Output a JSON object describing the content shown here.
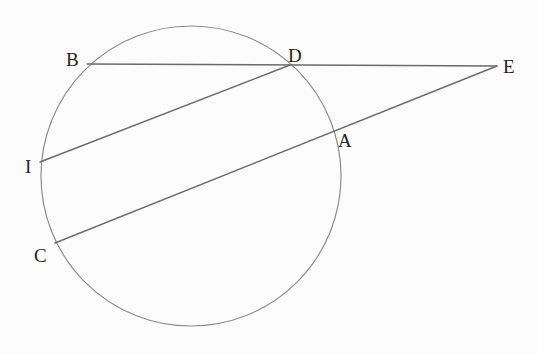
{
  "figure": {
    "type": "geometry-diagram",
    "labels": {
      "B": "B",
      "D": "D",
      "E": "E",
      "A": "A",
      "I": "I",
      "C": "C"
    },
    "elements": {
      "circle_points": [
        "B",
        "D",
        "A",
        "C",
        "I"
      ],
      "external_point": "E",
      "segments": [
        "B-D-E",
        "C-A-E",
        "I-D"
      ]
    }
  },
  "colors": {
    "background": "#fcfcfc",
    "line": "#6b6b6b",
    "circle_stroke": "#8c8c8c",
    "label_text": "#242424"
  }
}
